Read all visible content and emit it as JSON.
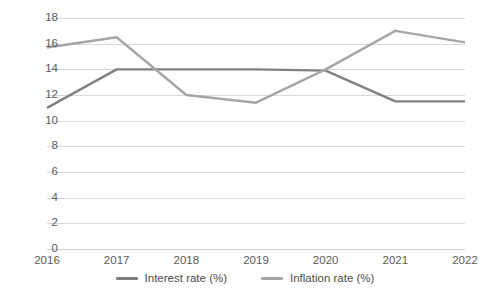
{
  "chart_data": {
    "type": "line",
    "title": "",
    "xlabel": "",
    "ylabel": "",
    "categories": [
      "2016",
      "2017",
      "2018",
      "2019",
      "2020",
      "2021",
      "2022"
    ],
    "ylim": [
      0,
      18
    ],
    "ytick_step": 2,
    "yticks": [
      "0",
      "2",
      "4",
      "6",
      "8",
      "10",
      "12",
      "14",
      "16",
      "18"
    ],
    "grid": true,
    "legend_position": "bottom",
    "series": [
      {
        "name": "Interest rate (%)",
        "color": "#808080",
        "values": [
          11.0,
          14.0,
          14.0,
          14.0,
          13.9,
          11.5,
          11.5
        ]
      },
      {
        "name": "Inflation rate (%)",
        "color": "#a6a6a6",
        "values": [
          15.7,
          16.5,
          12.0,
          11.4,
          14.0,
          17.0,
          16.1
        ]
      }
    ]
  },
  "legend": {
    "items": [
      {
        "label": "Interest rate (%)",
        "color": "#808080"
      },
      {
        "label": "Inflation rate (%)",
        "color": "#a6a6a6"
      }
    ]
  },
  "colors": {
    "gridline": "#d9d9d9",
    "tick_text": "#5a5a5a",
    "background": "#ffffff"
  }
}
